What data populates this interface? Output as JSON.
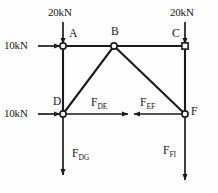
{
  "figure": {
    "type": "free-body-diagram",
    "stroke_color": "#1a1a1a",
    "background_color": "#fdfdfd"
  },
  "nodes": [
    {
      "id": "A",
      "label": "A",
      "marker": "circle",
      "x": 63,
      "y": 46
    },
    {
      "id": "B",
      "label": "B",
      "marker": "circle",
      "x": 114,
      "y": 46
    },
    {
      "id": "C",
      "label": "C",
      "marker": "square",
      "x": 185,
      "y": 46
    },
    {
      "id": "D",
      "label": "D",
      "marker": "circle",
      "x": 63,
      "y": 114
    },
    {
      "id": "F",
      "label": "F",
      "marker": "circle",
      "x": 185,
      "y": 114
    }
  ],
  "members": [
    {
      "from": "A",
      "to": "B"
    },
    {
      "from": "B",
      "to": "C"
    },
    {
      "from": "A",
      "to": "D"
    },
    {
      "from": "C",
      "to": "F"
    },
    {
      "from": "D",
      "to": "B"
    },
    {
      "from": "B",
      "to": "F"
    }
  ],
  "loads": [
    {
      "id": "load-a-vertical",
      "label": "20kN",
      "direction": "down",
      "applied_at": "A"
    },
    {
      "id": "load-c-vertical",
      "label": "20kN",
      "direction": "down",
      "applied_at": "C"
    },
    {
      "id": "load-a-horizontal",
      "label": "10kN",
      "direction": "right",
      "applied_at": "A"
    },
    {
      "id": "load-d-horizontal",
      "label": "10kN",
      "direction": "right",
      "applied_at": "D"
    }
  ],
  "internal_forces": [
    {
      "id": "force-de",
      "symbol": "F",
      "subscript": "DE",
      "direction": "right",
      "applied_at": "D"
    },
    {
      "id": "force-ef",
      "symbol": "F",
      "subscript": "EF",
      "direction": "left",
      "applied_at": "F"
    },
    {
      "id": "force-dg",
      "symbol": "F",
      "subscript": "DG",
      "direction": "down",
      "applied_at": "D"
    },
    {
      "id": "force-fi",
      "symbol": "F",
      "subscript": "FI",
      "direction": "down",
      "applied_at": "F"
    }
  ]
}
